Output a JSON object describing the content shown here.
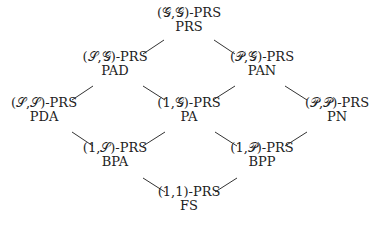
{
  "diagram": {
    "type": "hasse-lattice",
    "nodes": [
      {
        "id": "PRS",
        "line1": "(𝒢,𝒢)-PRS",
        "line2": "PRS",
        "x": 189,
        "y": 6
      },
      {
        "id": "PAD",
        "line1": "(𝒮,𝒢)-PRS",
        "line2": "PAD",
        "x": 115,
        "y": 50
      },
      {
        "id": "PAN",
        "line1": "(𝒫,𝒢)-PRS",
        "line2": "PAN",
        "x": 262,
        "y": 50
      },
      {
        "id": "PDA",
        "line1": "(𝒮,𝒮)-PRS",
        "line2": "PDA",
        "x": 44,
        "y": 96
      },
      {
        "id": "PA",
        "line1": "(1,𝒢)-PRS",
        "line2": "PA",
        "x": 189,
        "y": 96
      },
      {
        "id": "PN",
        "line1": "(𝒫,𝒫)-PRS",
        "line2": "PN",
        "x": 337,
        "y": 96
      },
      {
        "id": "BPA",
        "line1": "(1,𝒮)-PRS",
        "line2": "BPA",
        "x": 115,
        "y": 141
      },
      {
        "id": "BPP",
        "line1": "(1,𝒫)-PRS",
        "line2": "BPP",
        "x": 262,
        "y": 141
      },
      {
        "id": "FS",
        "line1": "(1,1)-PRS",
        "line2": "FS",
        "x": 189,
        "y": 185
      }
    ],
    "edges": [
      {
        "from": "PRS",
        "to": "PAD",
        "x1": 164,
        "y1": 40,
        "x2": 143,
        "y2": 54
      },
      {
        "from": "PRS",
        "to": "PAN",
        "x1": 214,
        "y1": 40,
        "x2": 235,
        "y2": 54
      },
      {
        "from": "PAD",
        "to": "PDA",
        "x1": 93,
        "y1": 86,
        "x2": 72,
        "y2": 100
      },
      {
        "from": "PAD",
        "to": "PA",
        "x1": 143,
        "y1": 86,
        "x2": 165,
        "y2": 100
      },
      {
        "from": "PAN",
        "to": "PA",
        "x1": 235,
        "y1": 86,
        "x2": 213,
        "y2": 100
      },
      {
        "from": "PAN",
        "to": "PN",
        "x1": 285,
        "y1": 86,
        "x2": 307,
        "y2": 100
      },
      {
        "from": "PDA",
        "to": "BPA",
        "x1": 72,
        "y1": 132,
        "x2": 93,
        "y2": 146
      },
      {
        "from": "PA",
        "to": "BPA",
        "x1": 165,
        "y1": 132,
        "x2": 143,
        "y2": 146
      },
      {
        "from": "PA",
        "to": "BPP",
        "x1": 215,
        "y1": 132,
        "x2": 237,
        "y2": 146
      },
      {
        "from": "PN",
        "to": "BPP",
        "x1": 307,
        "y1": 132,
        "x2": 285,
        "y2": 146
      },
      {
        "from": "BPA",
        "to": "FS",
        "x1": 143,
        "y1": 178,
        "x2": 165,
        "y2": 192
      },
      {
        "from": "BPP",
        "to": "FS",
        "x1": 237,
        "y1": 178,
        "x2": 215,
        "y2": 192
      }
    ],
    "colors": {
      "line": "#333333",
      "text": "#222222",
      "background": "#ffffff"
    }
  }
}
